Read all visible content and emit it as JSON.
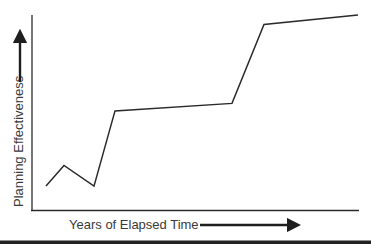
{
  "chart_data": {
    "type": "line",
    "title": "",
    "xlabel": "Years of Elapsed Time",
    "ylabel": "Planning Effectiveness",
    "grid": false,
    "legend": null,
    "axis_ticks": false,
    "x": [
      0,
      1,
      2,
      3,
      4,
      5,
      6
    ],
    "series": [
      {
        "name": "Planning Effectiveness",
        "values": [
          0.09,
          0.2,
          0.09,
          0.49,
          0.53,
          0.95,
          1.0
        ]
      }
    ],
    "annotations": [
      {
        "type": "arrow",
        "direction": "up",
        "near": "ylabel"
      },
      {
        "type": "arrow",
        "direction": "right",
        "near": "xlabel"
      }
    ],
    "colors": {
      "line": "#2a2a2a",
      "text": "#3a3a3a",
      "rule": "#222222"
    }
  }
}
